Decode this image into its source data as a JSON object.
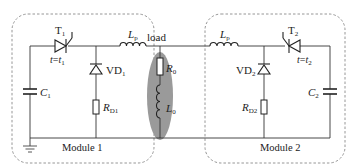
{
  "diagram": {
    "type": "circuit-schematic",
    "modules": [
      {
        "label": "Module 1",
        "components": [
          "T1",
          "VD1",
          "RD1",
          "Lp",
          "C1"
        ]
      },
      {
        "label": "Module 2",
        "components": [
          "T2",
          "VD2",
          "RD2",
          "Lp",
          "C2"
        ]
      }
    ],
    "load": {
      "label": "load",
      "resistor": {
        "sym": "R",
        "sub": "0"
      },
      "inductor": {
        "sym": "L",
        "sub": "0"
      }
    },
    "labels": {
      "t1": {
        "sym": "T",
        "sub": "1"
      },
      "t1_cond": {
        "pre": "t",
        "eq": "=",
        "sym": "t",
        "sub": "1"
      },
      "vd1": {
        "sym": "VD",
        "sub": "1"
      },
      "rd1": {
        "sym": "R",
        "sub": "D1"
      },
      "lp_left": {
        "sym": "L",
        "sub": "p"
      },
      "c1": {
        "sym": "C",
        "sub": "1"
      },
      "t2": {
        "sym": "T",
        "sub": "2"
      },
      "t2_cond": {
        "pre": "t",
        "eq": "=",
        "sym": "t",
        "sub": "2"
      },
      "vd2": {
        "sym": "VD",
        "sub": "2"
      },
      "rd2": {
        "sym": "R",
        "sub": "D2"
      },
      "lp_right": {
        "sym": "L",
        "sub": "p"
      },
      "c2": {
        "sym": "C",
        "sub": "2"
      }
    },
    "colors": {
      "wire": "#333333",
      "dashed_box": "#888888",
      "load_fill": "#9a9a9a"
    }
  }
}
